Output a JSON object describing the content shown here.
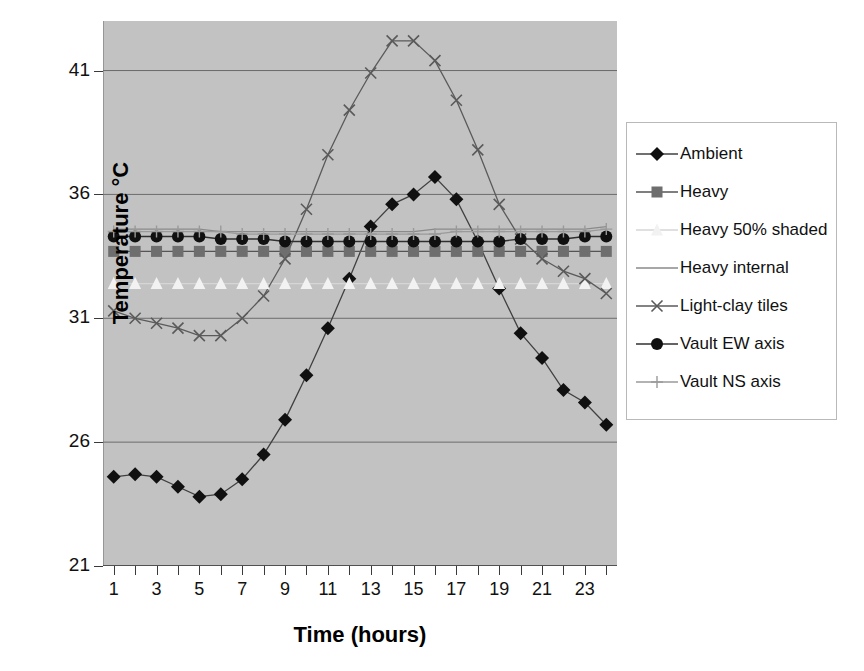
{
  "chart_data": {
    "type": "line",
    "title": "",
    "xlabel": "Time (hours)",
    "ylabel": "Temperature °C",
    "xlim": [
      0.5,
      24.5
    ],
    "ylim": [
      21,
      43
    ],
    "yticks": [
      21,
      26,
      31,
      36,
      41
    ],
    "xticks": [
      1,
      2,
      3,
      4,
      5,
      6,
      7,
      8,
      9,
      10,
      11,
      12,
      13,
      14,
      15,
      16,
      17,
      18,
      19,
      20,
      21,
      22,
      23,
      24
    ],
    "xtick_labels": [
      "1",
      "",
      "3",
      "",
      "5",
      "",
      "7",
      "",
      "9",
      "",
      "11",
      "",
      "13",
      "",
      "15",
      "",
      "17",
      "",
      "19",
      "",
      "21",
      "",
      "23",
      ""
    ],
    "grid": "horizontal",
    "legend_position": "right",
    "plot_background": "#c2c2c2",
    "x": [
      1,
      2,
      3,
      4,
      5,
      6,
      7,
      8,
      9,
      10,
      11,
      12,
      13,
      14,
      15,
      16,
      17,
      18,
      19,
      20,
      21,
      22,
      23,
      24
    ],
    "series": [
      {
        "name": "Ambient",
        "marker": "diamond",
        "color": "#101010",
        "line_color": "#404040",
        "values": [
          24.6,
          24.7,
          24.6,
          24.2,
          23.8,
          23.9,
          24.5,
          25.5,
          26.9,
          28.7,
          30.6,
          32.6,
          34.7,
          35.6,
          36.0,
          36.7,
          35.8,
          34.1,
          32.2,
          30.4,
          29.4,
          28.1,
          27.6,
          26.7
        ]
      },
      {
        "name": "Heavy",
        "marker": "square",
        "color": "#6e6e6e",
        "line_color": "#555555",
        "values": [
          33.7,
          33.7,
          33.7,
          33.7,
          33.7,
          33.7,
          33.7,
          33.7,
          33.7,
          33.7,
          33.7,
          33.7,
          33.7,
          33.7,
          33.7,
          33.7,
          33.7,
          33.7,
          33.7,
          33.7,
          33.7,
          33.7,
          33.7,
          33.7
        ]
      },
      {
        "name": "Heavy 50% shaded",
        "marker": "triangle",
        "color": "#f2f2f2",
        "line_color": "#d6d6d6",
        "values": [
          32.4,
          32.4,
          32.4,
          32.4,
          32.4,
          32.4,
          32.4,
          32.4,
          32.4,
          32.4,
          32.4,
          32.4,
          32.4,
          32.4,
          32.4,
          32.4,
          32.4,
          32.4,
          32.4,
          32.4,
          32.4,
          32.4,
          32.4,
          32.4
        ]
      },
      {
        "name": "Heavy internal",
        "marker": "none",
        "color": "#8a8a8a",
        "line_color": "#8a8a8a",
        "values": [
          34.6,
          34.6,
          34.6,
          34.6,
          34.6,
          34.5,
          34.5,
          34.5,
          34.5,
          34.5,
          34.5,
          34.5,
          34.5,
          34.5,
          34.5,
          34.6,
          34.6,
          34.6,
          34.6,
          34.6,
          34.6,
          34.6,
          34.6,
          34.7
        ]
      },
      {
        "name": "Light-clay tiles",
        "marker": "cross",
        "color": "#5a5a5a",
        "line_color": "#5a5a5a",
        "values": [
          31.3,
          31.0,
          30.8,
          30.6,
          30.3,
          30.3,
          31.0,
          31.9,
          33.4,
          35.4,
          37.6,
          39.4,
          40.9,
          42.2,
          42.2,
          41.4,
          39.8,
          37.8,
          35.6,
          34.2,
          33.4,
          32.9,
          32.6,
          32.0
        ]
      },
      {
        "name": "Vault EW axis",
        "marker": "circle",
        "color": "#101010",
        "line_color": "#303030",
        "values": [
          34.3,
          34.3,
          34.3,
          34.3,
          34.3,
          34.2,
          34.2,
          34.2,
          34.1,
          34.1,
          34.1,
          34.1,
          34.1,
          34.1,
          34.1,
          34.1,
          34.1,
          34.1,
          34.1,
          34.2,
          34.2,
          34.2,
          34.3,
          34.3
        ]
      },
      {
        "name": "Vault NS axis",
        "marker": "plus",
        "color": "#9a9a9a",
        "line_color": "#9a9a9a",
        "values": [
          34.5,
          34.5,
          34.5,
          34.5,
          34.5,
          34.5,
          34.4,
          34.4,
          34.4,
          34.4,
          34.4,
          34.4,
          34.4,
          34.4,
          34.4,
          34.4,
          34.5,
          34.5,
          34.5,
          34.5,
          34.5,
          34.5,
          34.5,
          34.6
        ]
      }
    ]
  },
  "legend": {
    "items": [
      {
        "label": "Ambient"
      },
      {
        "label": "Heavy"
      },
      {
        "label": "Heavy 50% shaded"
      },
      {
        "label": "Heavy internal"
      },
      {
        "label": "Light-clay tiles"
      },
      {
        "label": "Vault EW axis"
      },
      {
        "label": "Vault NS axis"
      }
    ]
  }
}
